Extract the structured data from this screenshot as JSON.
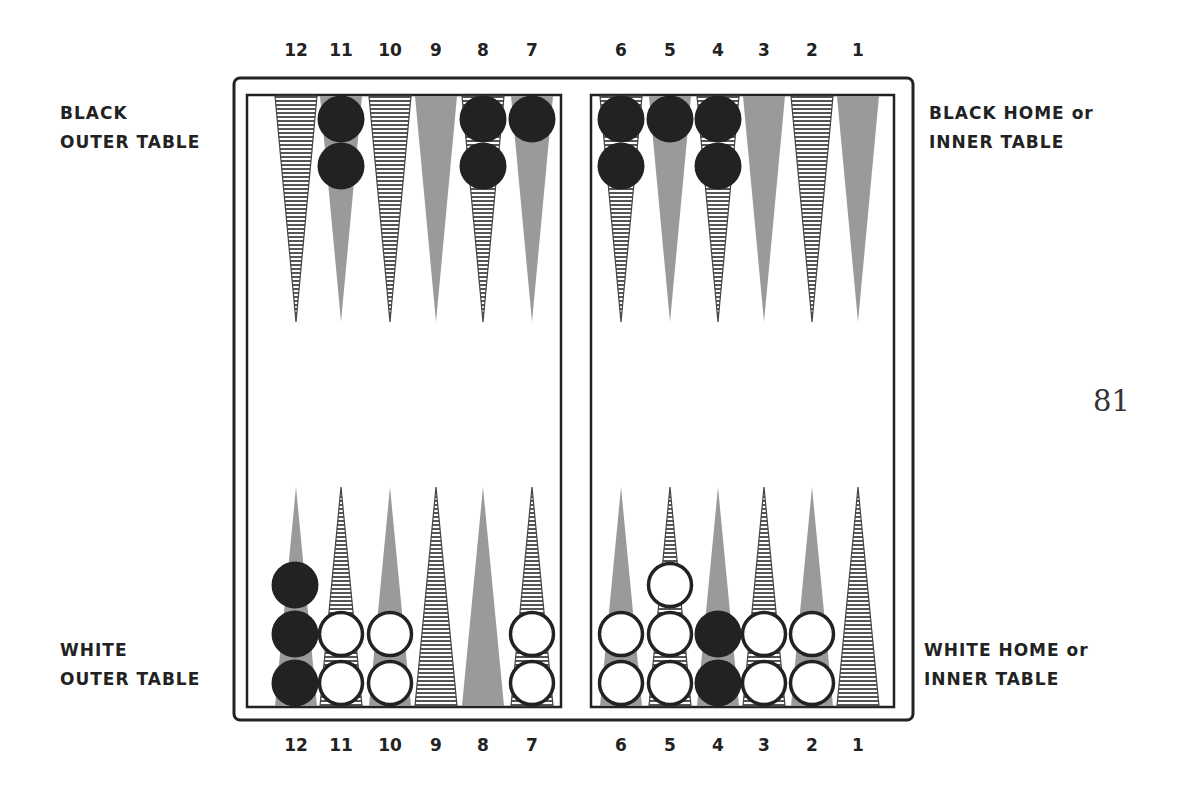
{
  "labels": {
    "black_outer": [
      "BLACK",
      "OUTER TABLE"
    ],
    "black_home": [
      "BLACK HOME or",
      "INNER TABLE"
    ],
    "white_outer": [
      "WHITE",
      "OUTER TABLE"
    ],
    "white_home": [
      "WHITE HOME or",
      "INNER TABLE"
    ]
  },
  "page_number": "81",
  "point_numbers": {
    "top": [
      "12",
      "11",
      "10",
      "9",
      "8",
      "7",
      "6",
      "5",
      "4",
      "3",
      "2",
      "1"
    ],
    "bottom": [
      "12",
      "11",
      "10",
      "9",
      "8",
      "7",
      "6",
      "5",
      "4",
      "3",
      "2",
      "1"
    ]
  },
  "colors": {
    "frame": "#222222",
    "gray_point": "#9a9a9a",
    "hatch_line": "#444444",
    "black_checker": "#222222",
    "white_checker": "#ffffff"
  },
  "board": {
    "top_points": [
      {
        "point": "12",
        "style": "hatched",
        "checkers": []
      },
      {
        "point": "11",
        "style": "gray",
        "checkers": [
          "black",
          "black"
        ]
      },
      {
        "point": "10",
        "style": "hatched",
        "checkers": []
      },
      {
        "point": "9",
        "style": "gray",
        "checkers": []
      },
      {
        "point": "8",
        "style": "hatched",
        "checkers": [
          "black",
          "black"
        ]
      },
      {
        "point": "7",
        "style": "gray",
        "checkers": [
          "black"
        ]
      },
      {
        "point": "6",
        "style": "hatched",
        "checkers": [
          "black",
          "black"
        ]
      },
      {
        "point": "5",
        "style": "gray",
        "checkers": [
          "black"
        ]
      },
      {
        "point": "4",
        "style": "hatched",
        "checkers": [
          "black",
          "black"
        ]
      },
      {
        "point": "3",
        "style": "gray",
        "checkers": []
      },
      {
        "point": "2",
        "style": "hatched",
        "checkers": []
      },
      {
        "point": "1",
        "style": "gray",
        "checkers": []
      }
    ],
    "bottom_points": [
      {
        "point": "12",
        "style": "gray",
        "checkers": [
          "black",
          "black",
          "black"
        ]
      },
      {
        "point": "11",
        "style": "hatched",
        "checkers": [
          "white",
          "white"
        ]
      },
      {
        "point": "10",
        "style": "gray",
        "checkers": [
          "white",
          "white"
        ]
      },
      {
        "point": "9",
        "style": "hatched",
        "checkers": []
      },
      {
        "point": "8",
        "style": "gray",
        "checkers": []
      },
      {
        "point": "7",
        "style": "hatched",
        "checkers": [
          "white",
          "white"
        ]
      },
      {
        "point": "6",
        "style": "gray",
        "checkers": [
          "white",
          "white"
        ]
      },
      {
        "point": "5",
        "style": "hatched",
        "checkers": [
          "white",
          "white",
          "white"
        ]
      },
      {
        "point": "4",
        "style": "gray",
        "checkers": [
          "black",
          "black"
        ]
      },
      {
        "point": "3",
        "style": "hatched",
        "checkers": [
          "white",
          "white"
        ]
      },
      {
        "point": "2",
        "style": "gray",
        "checkers": [
          "white",
          "white"
        ]
      },
      {
        "point": "1",
        "style": "hatched",
        "checkers": []
      }
    ]
  }
}
